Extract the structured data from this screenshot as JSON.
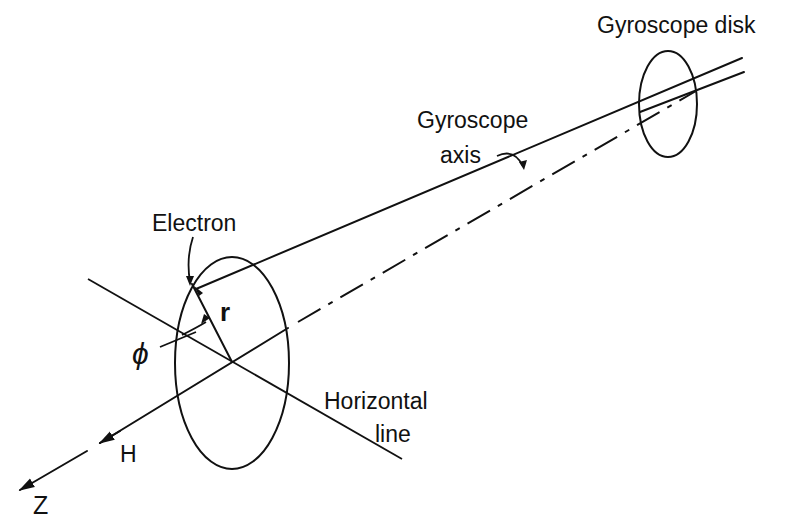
{
  "diagram": {
    "labels": {
      "gyroscope_disk": "Gyroscope disk",
      "gyroscope_axis_line1": "Gyroscope",
      "gyroscope_axis_line2": "axis",
      "electron": "Electron",
      "radius": "r",
      "angle": "ϕ",
      "horizontal_line_1": "Horizontal",
      "horizontal_line_2": "line",
      "field": "H",
      "z_axis": "Z"
    },
    "colors": {
      "ink": "#111111",
      "background": "#ffffff"
    }
  }
}
